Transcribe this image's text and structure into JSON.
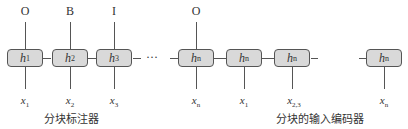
{
  "left_diagram": {
    "caption": "分块标注器",
    "cells": [
      {
        "h": "h",
        "h_sub": "1",
        "tag": "O",
        "x": "x",
        "x_sub": "1"
      },
      {
        "h": "h",
        "h_sub": "2",
        "tag": "B",
        "x": "x",
        "x_sub": "2"
      },
      {
        "h": "h",
        "h_sub": "3",
        "tag": "I",
        "x": "x",
        "x_sub": "3"
      },
      {
        "h": "h",
        "h_sub": "n",
        "tag": "O",
        "x": "x",
        "x_sub": "n"
      }
    ],
    "ellipsis": "···"
  },
  "right_diagram": {
    "caption": "分块的输入编码器",
    "cells": [
      {
        "h": "h",
        "h_sub": "n",
        "x": "x",
        "x_sub": "1"
      },
      {
        "h": "h",
        "h_sub": "n",
        "x": "x",
        "x_sub": "2,3"
      },
      {
        "h": "h",
        "h_sub": "n",
        "x": "x",
        "x_sub": "n"
      }
    ]
  }
}
